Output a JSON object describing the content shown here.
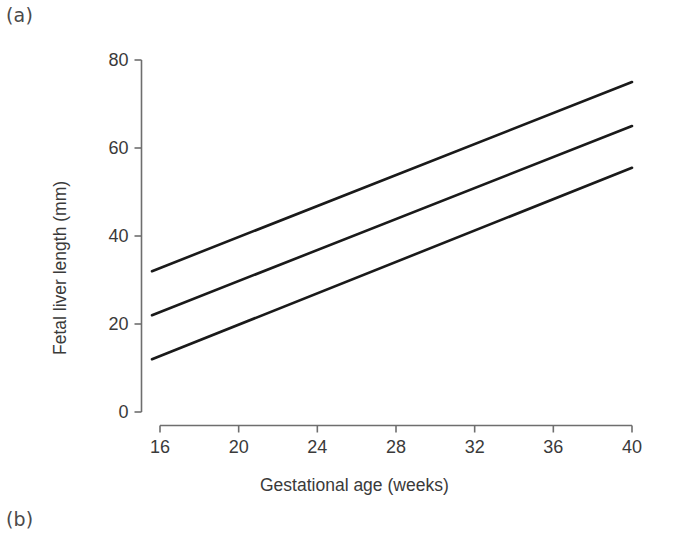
{
  "figure": {
    "panels": [
      {
        "id": "a",
        "label": "(a)"
      },
      {
        "id": "b",
        "label": "(b)"
      }
    ]
  },
  "chart_data": {
    "type": "line",
    "title": "",
    "subtitle": "",
    "xlabel": "Gestational age (weeks)",
    "ylabel": "Fetal liver length (mm)",
    "xlim": [
      16,
      40
    ],
    "ylim": [
      0,
      80
    ],
    "xticks": [
      16,
      20,
      24,
      28,
      32,
      36,
      40
    ],
    "yticks": [
      0,
      20,
      40,
      60,
      80
    ],
    "xtick_labels": [
      "16",
      "20",
      "24",
      "28",
      "32",
      "36",
      "40"
    ],
    "ytick_labels": [
      "0",
      "20",
      "40",
      "60",
      "80"
    ],
    "grid": false,
    "legend": null,
    "line_color": "#1a1a1a",
    "axis_color": "#6e6e6e",
    "series": [
      {
        "name": "upper centile",
        "x": [
          16,
          40
        ],
        "values": [
          32,
          75
        ]
      },
      {
        "name": "median",
        "x": [
          16,
          40
        ],
        "values": [
          22,
          65
        ]
      },
      {
        "name": "lower centile",
        "x": [
          16,
          40
        ],
        "values": [
          12,
          55.5
        ]
      }
    ],
    "annotations": []
  }
}
